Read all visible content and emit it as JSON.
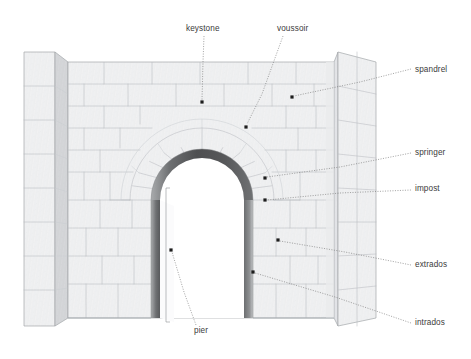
{
  "diagram": {
    "background_color": "#ffffff"
  },
  "colors": {
    "stone_light": "#f2f3f4",
    "stone_face": "#ededee",
    "stone_side_dark": "#c9cbcd",
    "stone_side_mid": "#dcdee0",
    "joint_line": "#b9bcc0",
    "outline": "#9aa0a6",
    "arch_band_dark": "#4f5052",
    "arch_band_mid": "#6d6f71",
    "arch_band_light": "#a9abad",
    "label_text": "#3b3b3b",
    "leader_line": "#6e6e6e",
    "leader_dot": "#1d1d1d"
  },
  "labels": [
    {
      "id": "keystone",
      "text": "keystone",
      "text_x": 186,
      "text_y": 31,
      "anchor": "start",
      "dot_x": 202,
      "dot_y": 102,
      "leader_points": "204,36 203,62 202,100",
      "style": "dotted"
    },
    {
      "id": "voussoir",
      "text": "voussoir",
      "text_x": 277,
      "text_y": 31,
      "anchor": "start",
      "dot_x": 246,
      "dot_y": 127,
      "leader_points": "283,36 262,94 247,124",
      "style": "dotted"
    },
    {
      "id": "spandrel",
      "text": "spandrel",
      "text_x": 415,
      "text_y": 72,
      "anchor": "start",
      "dot_x": 292,
      "dot_y": 97,
      "leader_points": "411,69 360,82 294,96",
      "style": "dotted"
    },
    {
      "id": "springer",
      "text": "springer",
      "text_x": 415,
      "text_y": 155,
      "anchor": "start",
      "dot_x": 265,
      "dot_y": 178,
      "leader_points": "411,153 340,167 267,177",
      "style": "dotted"
    },
    {
      "id": "impost",
      "text": "impost",
      "text_x": 415,
      "text_y": 191,
      "anchor": "start",
      "dot_x": 265,
      "dot_y": 200,
      "leader_points": "411,190 340,193 267,200",
      "style": "dotted"
    },
    {
      "id": "extrados",
      "text": "extrados",
      "text_x": 415,
      "text_y": 267,
      "anchor": "start",
      "dot_x": 278,
      "dot_y": 240,
      "leader_points": "411,265 345,252 280,241",
      "style": "dotted"
    },
    {
      "id": "intrados",
      "text": "intrados",
      "text_x": 415,
      "text_y": 325,
      "anchor": "start",
      "dot_x": 253,
      "dot_y": 272,
      "leader_points": "411,323 335,297 255,273",
      "style": "dotted"
    },
    {
      "id": "pier",
      "text": "pier",
      "text_x": 194,
      "text_y": 333,
      "anchor": "start",
      "dot_x": 171,
      "dot_y": 250,
      "leader_points": "196,325 184,292 172,252",
      "style": "dotted"
    }
  ],
  "structure": {
    "wall_top_y": 62,
    "wall_bottom_y": 318,
    "left_buttress": {
      "front_left_x": 24,
      "front_right_x": 62,
      "top_y": 52,
      "bottom_y": 326
    },
    "right_buttress": {
      "front_left_x": 338,
      "front_right_x": 376,
      "top_y": 52,
      "bottom_y": 326
    },
    "arch": {
      "center_x": 202,
      "springline_y": 200,
      "inner_radius": 42,
      "band_thickness": 9,
      "extrados_radius": 72
    },
    "opening": {
      "left_x": 160,
      "right_x": 244,
      "bottom_y": 318
    },
    "pier_bracket": {
      "x": 166,
      "top_y": 188,
      "bottom_y": 322
    }
  }
}
